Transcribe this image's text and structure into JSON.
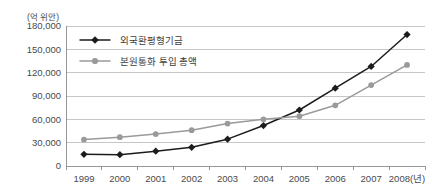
{
  "chart_data": {
    "type": "line",
    "title": "",
    "unit_label": "(억 위안)",
    "xlabel": "(년)",
    "ylabel": "",
    "categories": [
      "1999",
      "2000",
      "2001",
      "2002",
      "2003",
      "2004",
      "2005",
      "2006",
      "2007",
      "2008"
    ],
    "x_tick_labels": [
      "1999",
      "2000",
      "2001",
      "2002",
      "2003",
      "2004",
      "2005",
      "2006",
      "2007",
      "2008(년)"
    ],
    "y_tick_labels": [
      "180,000",
      "150,000",
      "120,000",
      "90,000",
      "60,000",
      "30,000",
      "0"
    ],
    "y_tick_values": [
      180000,
      150000,
      120000,
      90000,
      60000,
      30000,
      0
    ],
    "ylim": [
      0,
      180000
    ],
    "grid": true,
    "legend_position": "top-left-inside",
    "series": [
      {
        "name": "외국환평형기금",
        "color": "#1c1c1c",
        "marker": "diamond",
        "values": [
          15000,
          14500,
          19000,
          24000,
          34500,
          52000,
          72000,
          100000,
          128000,
          169000
        ]
      },
      {
        "name": "본원통화 투입 총액",
        "color": "#9a9a9a",
        "marker": "circle",
        "values": [
          34000,
          37000,
          41000,
          46000,
          54500,
          60000,
          64000,
          78000,
          104000,
          130000
        ]
      }
    ]
  },
  "legend": {
    "items": [
      {
        "label": "외국환평형기금"
      },
      {
        "label": "본원통화 투입 총액"
      }
    ]
  }
}
